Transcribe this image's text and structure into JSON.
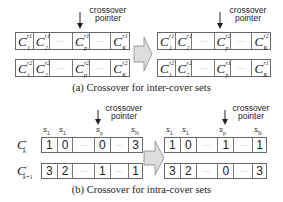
{
  "pointer_label_line1": "crossover",
  "pointer_label_line2": "pointer",
  "part_a": {
    "caption": "(a) Crossover for inter-cover sets",
    "before": {
      "row1": [
        {
          "base": "C",
          "sub": "1",
          "sup": "r1"
        },
        {
          "base": "C",
          "sub": "2",
          "sup": "r1"
        },
        {
          "dots": "···"
        },
        {
          "base": "C",
          "sub": "p",
          "sup": "r1"
        },
        {
          "dots": "···"
        },
        {
          "base": "C",
          "sub": "K",
          "sup": "r1"
        }
      ],
      "row2": [
        {
          "base": "C",
          "sub": "1",
          "sup": "r2"
        },
        {
          "base": "C",
          "sub": "2",
          "sup": "r2"
        },
        {
          "dots": "···"
        },
        {
          "base": "C",
          "sub": "p",
          "sup": "r2"
        },
        {
          "dots": "···"
        },
        {
          "base": "C",
          "sub": "K",
          "sup": "r2"
        }
      ]
    },
    "after": {
      "row1": [
        {
          "base": "C",
          "sub": "1",
          "sup": "r1"
        },
        {
          "base": "C",
          "sub": "2",
          "sup": "r1"
        },
        {
          "dots": "···"
        },
        {
          "base": "C",
          "sub": "p",
          "sup": "r2"
        },
        {
          "dots": "···"
        },
        {
          "base": "C",
          "sub": "K",
          "sup": "r2"
        }
      ],
      "row2": [
        {
          "base": "C",
          "sub": "1",
          "sup": "r2"
        },
        {
          "base": "C",
          "sub": "2",
          "sup": "r2"
        },
        {
          "dots": "···"
        },
        {
          "base": "C",
          "sub": "p",
          "sup": "r1"
        },
        {
          "dots": "···"
        },
        {
          "base": "C",
          "sub": "K",
          "sup": "r1"
        }
      ]
    }
  },
  "part_b": {
    "caption": "(b) Crossover for intra-cover sets",
    "row_labels": [
      {
        "base": "C",
        "sup": "′",
        "sub": "k"
      },
      {
        "base": "C",
        "sup": "′",
        "sub": "k+1"
      }
    ],
    "sensor_labels": [
      {
        "base": "s",
        "sub": "1"
      },
      {
        "base": "s",
        "sub": "1"
      },
      {
        "base": "s",
        "sub": "p"
      },
      {
        "base": "s",
        "sub": "N"
      }
    ],
    "dots": "···",
    "before": {
      "row1": [
        "1",
        "0",
        "···",
        "0",
        "···",
        "3"
      ],
      "row2": [
        "3",
        "2",
        "···",
        "1",
        "···",
        "1"
      ]
    },
    "after": {
      "row1": [
        "1",
        "0",
        "···",
        "1",
        "···",
        "1"
      ],
      "row2": [
        "3",
        "2",
        "···",
        "0",
        "···",
        "3"
      ]
    }
  }
}
